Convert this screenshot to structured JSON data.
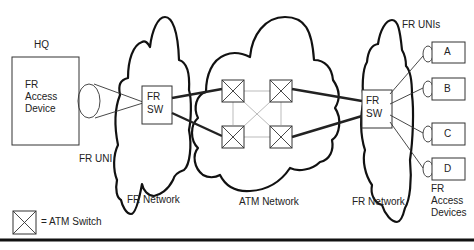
{
  "diagram": {
    "hq_label": "HQ",
    "hq_device": [
      "FR",
      "Access",
      "Device"
    ],
    "fr_uni_label": "FR UNI",
    "fr_uni_plural_label": "FR UNIs",
    "left_switch": [
      "FR",
      "SW"
    ],
    "right_switch": [
      "FR",
      "SW"
    ],
    "left_network_label": "FR Network",
    "atm_network_label": "ATM Network",
    "right_network_label": "FR Network",
    "remote_devices": [
      "A",
      "B",
      "C",
      "D"
    ],
    "remote_devices_label": [
      "FR",
      "Access",
      "Devices"
    ],
    "legend": {
      "symbol": "atm-switch-symbol",
      "text": "= ATM Switch"
    },
    "colors": {
      "line": "#222222",
      "mesh": "#bbbbbb",
      "background": "#ffffff"
    }
  }
}
